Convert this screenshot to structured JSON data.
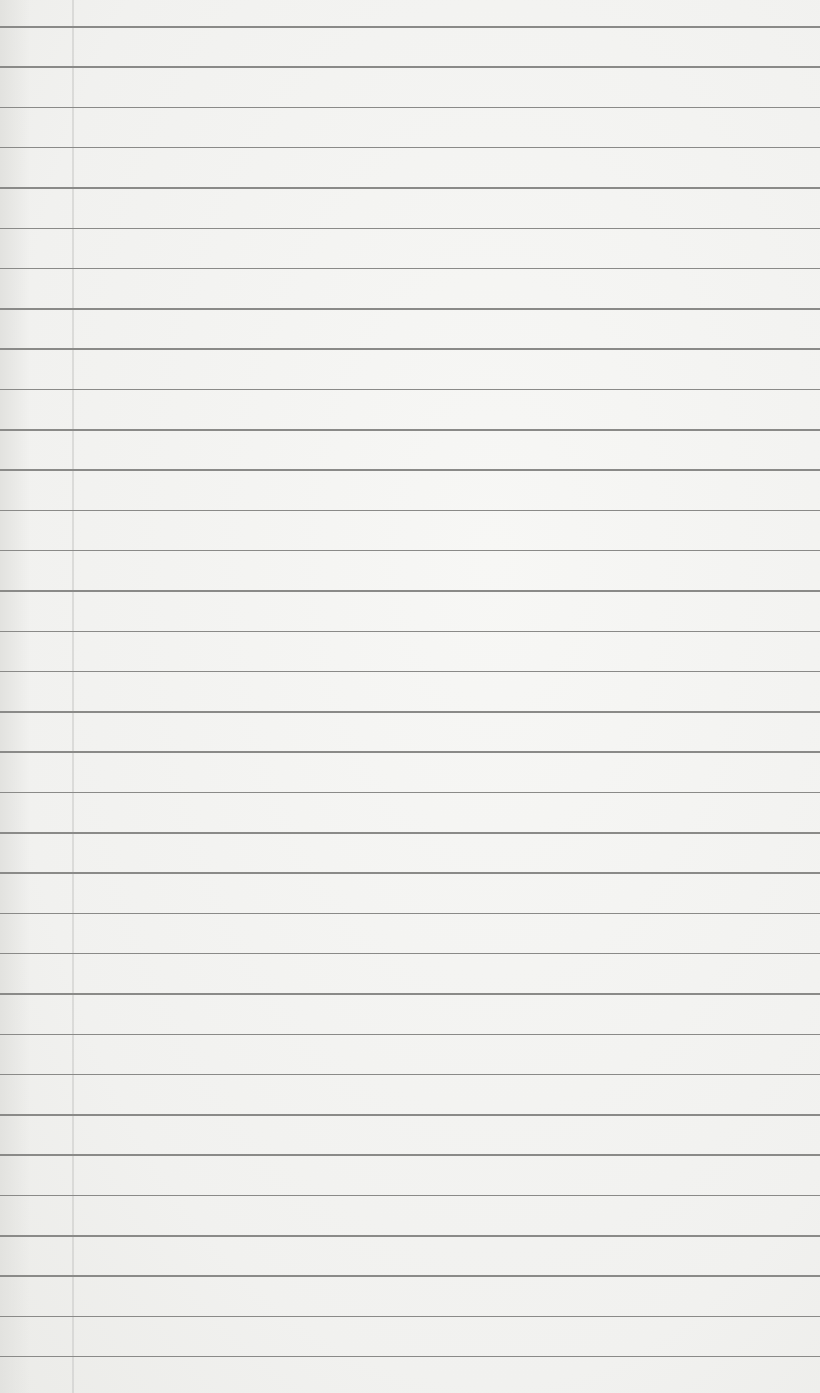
{
  "paper": {
    "type": "lined notebook page",
    "background_color": "#f4f4f2",
    "rule_color": "#8a8a88",
    "margin_line_color": "#c8c8c6",
    "margin_line_x": 72,
    "first_rule_y": 26,
    "rule_spacing": 40.3,
    "rule_count": 34,
    "text_content": ""
  }
}
